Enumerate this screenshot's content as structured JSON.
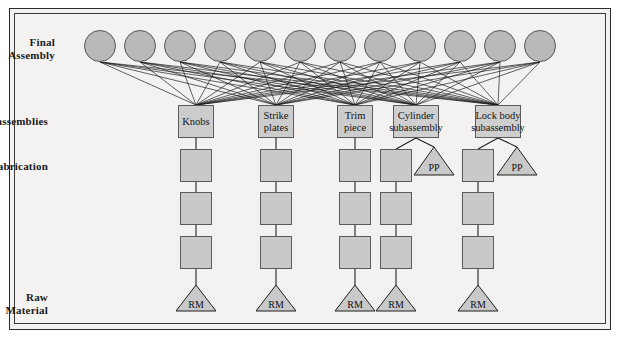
{
  "diagram": {
    "background_color": "#f3f2f0",
    "node_fill": "#c9c9c9",
    "circle_fill": "#b9b9b9",
    "line_color": "#1f1f1f"
  },
  "row_labels": [
    {
      "id": "final-assembly",
      "text": "Final\nAssembly",
      "x": 55,
      "y": 36
    },
    {
      "id": "subassemblies",
      "text": "Subassemblies",
      "x": 48,
      "y": 115
    },
    {
      "id": "fabrication",
      "text": "Fabrication",
      "x": 48,
      "y": 160
    },
    {
      "id": "raw-material",
      "text": "Raw Material",
      "x": 48,
      "y": 291
    }
  ],
  "final_assembly": {
    "label": "Final Assembly",
    "count": 12,
    "circle_diameter": 32,
    "y": 30,
    "x_positions": [
      100,
      140,
      180,
      220,
      260,
      300,
      340,
      380,
      420,
      460,
      500,
      540
    ]
  },
  "subassemblies": [
    {
      "id": "knobs",
      "label": "Knobs",
      "x": 178,
      "y": 105,
      "w": 36,
      "h": 33
    },
    {
      "id": "strike-plates",
      "label": "Strike\nplates",
      "x": 258,
      "y": 105,
      "w": 36,
      "h": 33
    },
    {
      "id": "trim-piece",
      "label": "Trim\npiece",
      "x": 337,
      "y": 105,
      "w": 36,
      "h": 33
    },
    {
      "id": "cylinder-subassembly",
      "label": "Cylinder\nsubassembly",
      "x": 393,
      "y": 105,
      "w": 46,
      "h": 33
    },
    {
      "id": "lock-body-subassembly",
      "label": "Lock body\nsubassembly",
      "x": 475,
      "y": 105,
      "w": 46,
      "h": 33
    }
  ],
  "fabrication_columns": [
    {
      "id": "col-knobs",
      "cx": 196,
      "boxes_y": [
        149,
        192,
        236
      ],
      "box_w": 32,
      "box_h": 33
    },
    {
      "id": "col-strike-plates",
      "cx": 276,
      "boxes_y": [
        149,
        192,
        236
      ],
      "box_w": 32,
      "box_h": 33
    },
    {
      "id": "col-trim-piece",
      "cx": 355,
      "boxes_y": [
        149,
        192,
        236
      ],
      "box_w": 32,
      "box_h": 33
    },
    {
      "id": "col-cylinder",
      "cx": 396,
      "boxes_y": [
        149,
        192,
        236
      ],
      "box_w": 32,
      "box_h": 33
    },
    {
      "id": "col-lock-body",
      "cx": 478,
      "boxes_y": [
        149,
        192,
        236
      ],
      "box_w": 32,
      "box_h": 33
    }
  ],
  "purchased_parts": [
    {
      "id": "pp-cylinder",
      "label": "PP",
      "cx": 434,
      "y_top": 147,
      "w": 40,
      "h": 28
    },
    {
      "id": "pp-lock-body",
      "label": "PP",
      "cx": 517,
      "y_top": 147,
      "w": 40,
      "h": 28
    }
  ],
  "raw_materials": [
    {
      "id": "rm-knobs",
      "label": "RM",
      "cx": 196,
      "y_top": 285,
      "w": 40,
      "h": 26
    },
    {
      "id": "rm-strike-plates",
      "label": "RM",
      "cx": 276,
      "y_top": 285,
      "w": 40,
      "h": 26
    },
    {
      "id": "rm-trim-piece",
      "label": "RM",
      "cx": 355,
      "y_top": 285,
      "w": 40,
      "h": 26
    },
    {
      "id": "rm-cylinder",
      "label": "RM",
      "cx": 396,
      "y_top": 285,
      "w": 40,
      "h": 26
    },
    {
      "id": "rm-lock-body",
      "label": "RM",
      "cx": 478,
      "y_top": 285,
      "w": 40,
      "h": 26
    }
  ],
  "edges_note": "Every final assembly circle connects down to every subassembly box, forming a dense many-to-many fan."
}
